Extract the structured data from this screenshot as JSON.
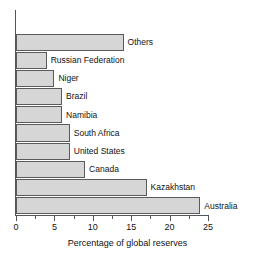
{
  "chart_data": {
    "type": "bar",
    "orientation": "horizontal",
    "title": "",
    "xlabel": "Percentage of global reserves",
    "ylabel": "",
    "xlim": [
      0,
      25
    ],
    "xticks": [
      0,
      5,
      10,
      15,
      20,
      25
    ],
    "xtick_labels": [
      "0",
      "5",
      "10",
      "15",
      "20",
      "25"
    ],
    "minor_tick_step": 2.5,
    "grid": false,
    "legend": null,
    "categories": [
      "Others",
      "Russian Federation",
      "Niger",
      "Brazil",
      "Namibia",
      "South Africa",
      "United States",
      "Canada",
      "Kazakhstan",
      "Australia"
    ],
    "values": [
      14,
      4,
      5,
      6,
      6,
      7,
      7,
      9,
      17,
      24
    ],
    "bar_fill_color": "#d6d6d6",
    "bar_edge_color": "#5a5a5a",
    "axis_color": "#555555",
    "background_color": "#ffffff"
  }
}
